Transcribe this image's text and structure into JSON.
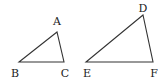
{
  "diagram": {
    "type": "similar-triangles",
    "triangles": [
      {
        "name": "ABC",
        "vertices": [
          {
            "label": "A",
            "x": 57,
            "y": 32,
            "lx": 57,
            "ly": 21
          },
          {
            "label": "B",
            "x": 19,
            "y": 62,
            "lx": 15,
            "ly": 73
          },
          {
            "label": "C",
            "x": 64,
            "y": 62,
            "lx": 65,
            "ly": 73
          }
        ]
      },
      {
        "name": "DEF",
        "vertices": [
          {
            "label": "D",
            "x": 143,
            "y": 15,
            "lx": 143,
            "ly": 8
          },
          {
            "label": "E",
            "x": 86,
            "y": 62,
            "lx": 87,
            "ly": 73
          },
          {
            "label": "F",
            "x": 153,
            "y": 62,
            "lx": 154,
            "ly": 73
          }
        ]
      }
    ],
    "colors": {
      "stroke": "#333333",
      "text": "#222222",
      "background": "#ffffff"
    }
  }
}
